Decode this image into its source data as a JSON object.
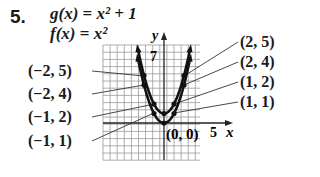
{
  "problem": {
    "number": "5.",
    "equations": [
      {
        "lhs": "g(x)",
        "rhs": "x² + 1"
      },
      {
        "lhs": "f(x)",
        "rhs": "x²"
      }
    ]
  },
  "axes": {
    "x_label": "x",
    "y_label": "y",
    "x_tick": "5",
    "y_tick": "7"
  },
  "labels_left": [
    "(−2, 5)",
    "(−2, 4)",
    "(−1, 2)",
    "(−1, 1)"
  ],
  "labels_right": [
    "(2, 5)",
    "(2, 4)",
    "(1, 2)",
    "(1, 1)"
  ],
  "origin_label": "(0, 0)",
  "chart_data": {
    "type": "line",
    "title": "",
    "xlabel": "x",
    "ylabel": "y",
    "series": [
      {
        "name": "g(x) = x² + 1",
        "x": [
          -2,
          -1,
          0,
          1,
          2
        ],
        "y": [
          5,
          2,
          1,
          2,
          5
        ]
      },
      {
        "name": "f(x) = x²",
        "x": [
          -2,
          -1,
          0,
          1,
          2
        ],
        "y": [
          4,
          1,
          0,
          1,
          4
        ]
      }
    ],
    "annotations": [
      "(−2, 5)",
      "(−2, 4)",
      "(−1, 2)",
      "(−1, 1)",
      "(2, 5)",
      "(2, 4)",
      "(1, 2)",
      "(1, 1)",
      "(0, 0)"
    ],
    "xlim": [
      -8,
      5
    ],
    "ylim": [
      -5,
      10
    ],
    "grid": true
  }
}
